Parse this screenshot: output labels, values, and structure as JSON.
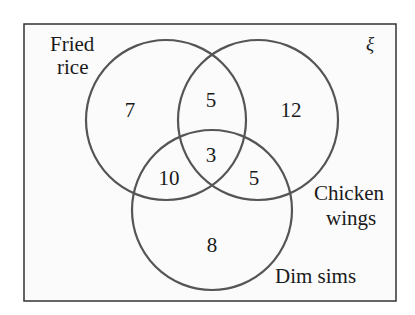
{
  "diagram": {
    "type": "venn",
    "universal_symbol": "ξ",
    "sets": [
      {
        "id": "fried_rice",
        "label_lines": [
          "Fried",
          "rice"
        ]
      },
      {
        "id": "chicken_wings",
        "label_lines": [
          "Chicken",
          "wings"
        ]
      },
      {
        "id": "dim_sims",
        "label_lines": [
          "Dim sims"
        ]
      }
    ],
    "regions": {
      "fried_rice_only": "7",
      "chicken_wings_only": "12",
      "dim_sims_only": "8",
      "fried_rice_and_chicken_wings_only": "5",
      "fried_rice_and_dim_sims_only": "10",
      "chicken_wings_and_dim_sims_only": "5",
      "all_three": "3"
    },
    "colors": {
      "circle_stroke": "#555555",
      "border_stroke": "#333333",
      "text": "#1a1a1a",
      "background": "#fbfbfb"
    }
  }
}
